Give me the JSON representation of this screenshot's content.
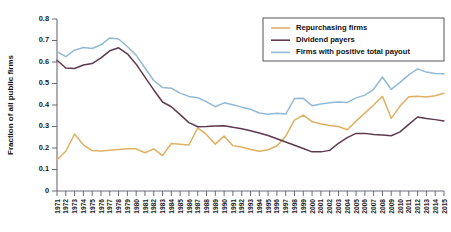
{
  "chart_data": {
    "type": "line",
    "title": "",
    "xlabel": "",
    "ylabel": "Fraction of all public firms",
    "ylim": [
      0,
      0.8
    ],
    "yticks": [
      0,
      0.1,
      0.2,
      0.3,
      0.4,
      0.5,
      0.6,
      0.7,
      0.8
    ],
    "ytick_labels": [
      "0",
      "0.1",
      "0.2",
      "0.3",
      "0.4",
      "0.5",
      "0.6",
      "0.7",
      "0.8"
    ],
    "grid": false,
    "legend_position": "top-right",
    "x": [
      1971,
      1972,
      1973,
      1974,
      1975,
      1976,
      1977,
      1978,
      1979,
      1980,
      1981,
      1982,
      1983,
      1984,
      1985,
      1986,
      1987,
      1988,
      1989,
      1990,
      1991,
      1992,
      1993,
      1994,
      1995,
      1996,
      1997,
      1998,
      1999,
      2000,
      2001,
      2002,
      2003,
      2004,
      2005,
      2006,
      2007,
      2008,
      2009,
      2010,
      2011,
      2012,
      2013,
      2014,
      2015
    ],
    "categories": [
      "1971",
      "1972",
      "1973",
      "1974",
      "1975",
      "1976",
      "1977",
      "1978",
      "1979",
      "1980",
      "1981",
      "1982",
      "1983",
      "1984",
      "1985",
      "1986",
      "1987",
      "1988",
      "1989",
      "1990",
      "1991",
      "1992",
      "1993",
      "1994",
      "1995",
      "1996",
      "1997",
      "1998",
      "1999",
      "2000",
      "2001",
      "2002",
      "2003",
      "2004",
      "2005",
      "2006",
      "2007",
      "2008",
      "2009",
      "2010",
      "2011",
      "2012",
      "2013",
      "2014",
      "2015"
    ],
    "series": [
      {
        "name": "Repurchasing firms",
        "color": "#e0b063",
        "values": [
          0.145,
          0.185,
          0.265,
          0.215,
          0.188,
          0.186,
          0.19,
          0.193,
          0.197,
          0.196,
          0.178,
          0.196,
          0.165,
          0.221,
          0.218,
          0.214,
          0.294,
          0.262,
          0.218,
          0.256,
          0.211,
          0.205,
          0.193,
          0.185,
          0.192,
          0.209,
          0.255,
          0.33,
          0.353,
          0.323,
          0.312,
          0.305,
          0.3,
          0.285,
          0.325,
          0.362,
          0.4,
          0.44,
          0.338,
          0.395,
          0.438,
          0.441,
          0.437,
          0.443,
          0.455
        ]
      },
      {
        "name": "Dividend payers",
        "color": "#5d3a4e",
        "values": [
          0.608,
          0.572,
          0.57,
          0.586,
          0.593,
          0.619,
          0.652,
          0.666,
          0.638,
          0.59,
          0.53,
          0.47,
          0.414,
          0.392,
          0.355,
          0.318,
          0.299,
          0.3,
          0.302,
          0.303,
          0.296,
          0.29,
          0.28,
          0.27,
          0.258,
          0.243,
          0.228,
          0.213,
          0.198,
          0.182,
          0.182,
          0.189,
          0.222,
          0.248,
          0.268,
          0.268,
          0.263,
          0.26,
          0.257,
          0.275,
          0.31,
          0.344,
          0.337,
          0.332,
          0.326
        ]
      },
      {
        "name": "Firms with positive total payout",
        "color": "#93b9d6",
        "values": [
          0.648,
          0.625,
          0.655,
          0.667,
          0.663,
          0.68,
          0.712,
          0.707,
          0.672,
          0.632,
          0.572,
          0.514,
          0.481,
          0.478,
          0.455,
          0.44,
          0.434,
          0.415,
          0.392,
          0.41,
          0.401,
          0.39,
          0.38,
          0.363,
          0.357,
          0.362,
          0.358,
          0.43,
          0.431,
          0.397,
          0.405,
          0.41,
          0.414,
          0.412,
          0.433,
          0.446,
          0.473,
          0.53,
          0.473,
          0.505,
          0.54,
          0.568,
          0.553,
          0.546,
          0.545
        ]
      }
    ],
    "legend": [
      {
        "label": "Repurchasing firms",
        "color": "#e0b063"
      },
      {
        "label": "Dividend payers",
        "color": "#5d3a4e"
      },
      {
        "label": "Firms with positive total payout",
        "color": "#93b9d6"
      }
    ]
  }
}
